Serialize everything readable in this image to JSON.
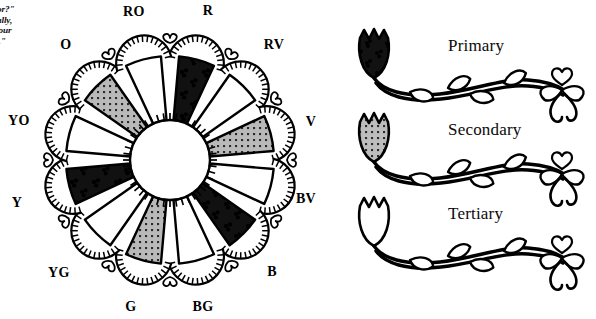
{
  "quote": {
    "lines": [
      "color?\"",
      "refully,",
      "ct your",
      "ods.\""
    ]
  },
  "wheel": {
    "title": "color-wheel",
    "center_fill": "#ffffff",
    "fills": {
      "primary": "#111111",
      "secondary": "#b3b3b3",
      "tertiary": "#ffffff"
    },
    "segments": [
      {
        "label": "R",
        "angle": 15,
        "category": "primary"
      },
      {
        "label": "RV",
        "angle": 45,
        "category": "tertiary"
      },
      {
        "label": "V",
        "angle": 75,
        "category": "secondary"
      },
      {
        "label": "BV",
        "angle": 105,
        "category": "tertiary"
      },
      {
        "label": "B",
        "angle": 135,
        "category": "primary"
      },
      {
        "label": "BG",
        "angle": 165,
        "category": "tertiary"
      },
      {
        "label": "G",
        "angle": 195,
        "category": "secondary"
      },
      {
        "label": "YG",
        "angle": 225,
        "category": "tertiary"
      },
      {
        "label": "Y",
        "angle": 255,
        "category": "primary"
      },
      {
        "label": "YO",
        "angle": 285,
        "category": "tertiary"
      },
      {
        "label": "O",
        "angle": 315,
        "category": "secondary"
      },
      {
        "label": "RO",
        "angle": 345,
        "category": "tertiary"
      }
    ],
    "labels": [
      {
        "text": "RO",
        "x": 134,
        "y": 12
      },
      {
        "text": "R",
        "x": 208,
        "y": 11
      },
      {
        "text": "RV",
        "x": 274,
        "y": 45
      },
      {
        "text": "V",
        "x": 311,
        "y": 122
      },
      {
        "text": "BV",
        "x": 306,
        "y": 199
      },
      {
        "text": "B",
        "x": 272,
        "y": 272
      },
      {
        "text": "BG",
        "x": 203,
        "y": 307
      },
      {
        "text": "G",
        "x": 131,
        "y": 307
      },
      {
        "text": "YG",
        "x": 59,
        "y": 273
      },
      {
        "text": "Y",
        "x": 17,
        "y": 203
      },
      {
        "text": "YO",
        "x": 19,
        "y": 121
      },
      {
        "text": "O",
        "x": 66,
        "y": 45
      }
    ]
  },
  "legend": {
    "rows": [
      {
        "label": "Primary",
        "swatch": "dark-tulip-icon",
        "fill": "#111111"
      },
      {
        "label": "Secondary",
        "swatch": "gray-tulip-icon",
        "fill": "#b3b3b3"
      },
      {
        "label": "Tertiary",
        "swatch": "white-tulip-icon",
        "fill": "#ffffff"
      }
    ]
  }
}
